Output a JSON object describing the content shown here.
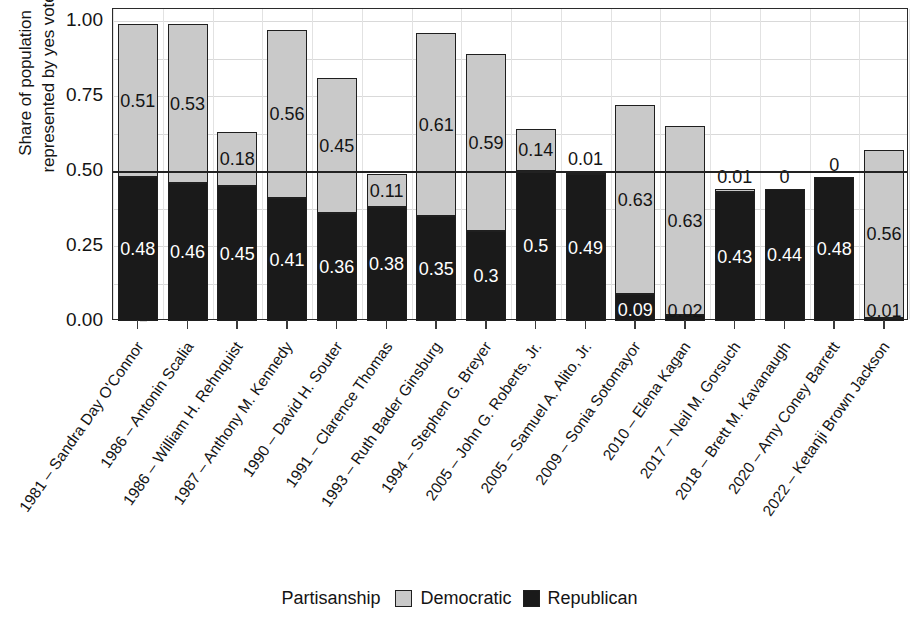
{
  "chart_data": {
    "type": "bar",
    "subtype": "stacked-bar",
    "title": "",
    "xlabel": "",
    "ylabel": "Share of population\nrepresented by yes vote",
    "ylim": [
      0,
      1
    ],
    "yticks": [
      "0.00",
      "0.25",
      "0.50",
      "0.75",
      "1.00"
    ],
    "ytick_values": [
      0,
      0.25,
      0.5,
      0.75,
      1
    ],
    "grid": true,
    "reference_line": 0.5,
    "legend_position": "bottom",
    "legend_title": "Partisanship",
    "categories": [
      "1981 – Sandra Day O'Connor",
      "1986 – Antonin Scalia",
      "1986 – William H. Rehnquist",
      "1987 – Anthony M. Kennedy",
      "1990 – David H. Souter",
      "1991 – Clarence Thomas",
      "1993 – Ruth Bader Ginsburg",
      "1994 – Stephen G. Breyer",
      "2005 – John G. Roberts, Jr.",
      "2005 – Samuel A. Alito, Jr.",
      "2009 – Sonia Sotomayor",
      "2010 – Elena Kagan",
      "2017 – Neil M. Gorsuch",
      "2018 – Brett M. Kavanaugh",
      "2020 – Amy Coney Barrett",
      "2022 – Ketanji Brown Jackson"
    ],
    "series": [
      {
        "name": "Republican",
        "color": "#1a1a1a",
        "values": [
          0.48,
          0.46,
          0.45,
          0.41,
          0.36,
          0.38,
          0.35,
          0.3,
          0.5,
          0.49,
          0.09,
          0.02,
          0.43,
          0.44,
          0.48,
          0.01
        ],
        "labels": [
          "0.48",
          "0.46",
          "0.45",
          "0.41",
          "0.36",
          "0.38",
          "0.35",
          "0.3",
          "0.5",
          "0.49",
          "0.09",
          "0.02",
          "0.43",
          "0.44",
          "0.48",
          "0.01"
        ]
      },
      {
        "name": "Democratic",
        "color": "#c9c9c9",
        "values": [
          0.51,
          0.53,
          0.18,
          0.56,
          0.45,
          0.11,
          0.61,
          0.59,
          0.14,
          0.01,
          0.63,
          0.63,
          0.01,
          0.0,
          0.0,
          0.56
        ],
        "labels": [
          "0.51",
          "0.53",
          "0.18",
          "0.56",
          "0.45",
          "0.11",
          "0.61",
          "0.59",
          "0.14",
          "0.01",
          "0.63",
          "0.63",
          "0.01",
          "0",
          "0",
          "0.56"
        ]
      }
    ],
    "totals": [
      0.99,
      0.99,
      0.63,
      0.97,
      0.81,
      0.49,
      0.96,
      0.89,
      0.64,
      0.5,
      0.72,
      0.65,
      0.44,
      0.44,
      0.48,
      0.57
    ]
  },
  "legend": {
    "title": "Partisanship",
    "items": [
      {
        "label": "Democratic",
        "color": "#c9c9c9"
      },
      {
        "label": "Republican",
        "color": "#1a1a1a"
      }
    ]
  },
  "axis": {
    "y_title_line1": "Share of population",
    "y_title_line2": "represented by yes vote"
  }
}
